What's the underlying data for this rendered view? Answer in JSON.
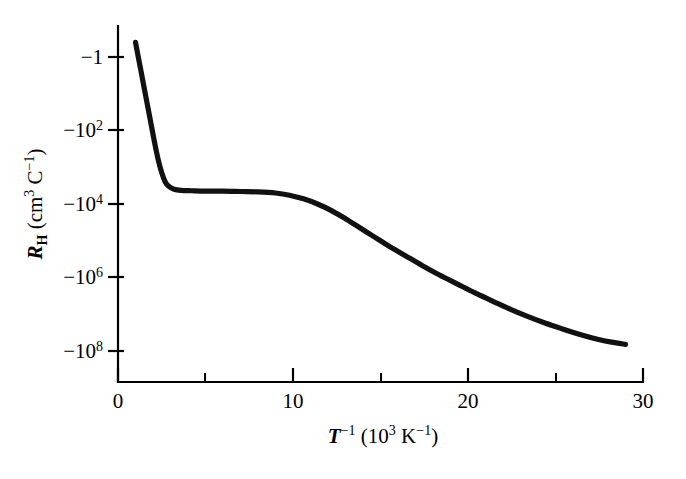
{
  "figure": {
    "background_color": "#ffffff",
    "ink_color": "#111111"
  },
  "chart_data": {
    "type": "line",
    "title": "",
    "subtitle": "",
    "xlabel": "T^-1 (10^3 K^-1)",
    "ylabel": "R_H (cm^3 C^-1)",
    "xlabel_parts": {
      "symbol": "T",
      "symbol_exponent": "−1",
      "units_open": " (10",
      "units_exponent": "3",
      "units_mid": " K",
      "units_exponent2": "−1",
      "units_close": ")"
    },
    "ylabel_parts": {
      "symbol": "R",
      "symbol_subscript": "H",
      "units_open": " (cm",
      "units_exponent": "3",
      "units_mid": " C",
      "units_exponent2": "−1",
      "units_close": ")"
    },
    "grid": false,
    "legend": false,
    "legend_position": "none",
    "xlim": [
      0,
      30
    ],
    "ylim_label": "negative logarithmic, -1 to -10^8",
    "x_ticks_major": [
      0,
      10,
      20,
      30
    ],
    "x_tick_labels": [
      "0",
      "10",
      "20",
      "30"
    ],
    "x_ticks_minor": [
      5,
      15,
      25
    ],
    "y_ticks_major": [
      {
        "label_mantissa": "−1",
        "label_exponent": "",
        "decade": 0
      },
      {
        "label_mantissa": "−10",
        "label_exponent": "2",
        "decade": 2
      },
      {
        "label_mantissa": "−10",
        "label_exponent": "4",
        "decade": 4
      },
      {
        "label_mantissa": "−10",
        "label_exponent": "6",
        "decade": 6
      },
      {
        "label_mantissa": "−10",
        "label_exponent": "8",
        "decade": 8
      }
    ],
    "y_tick_labels": [
      "−1",
      "−10²",
      "−10⁴",
      "−10⁶",
      "−10⁸"
    ],
    "series": [
      {
        "name": "Hall coefficient",
        "color": "#111111",
        "comment": "x = inverse temperature in 10^3 K^-1; y = decades of -R_H, i.e. R_H = -10^(y)",
        "x": [
          1.0,
          1.3,
          1.6,
          1.9,
          2.1,
          2.3,
          2.5,
          2.7,
          2.9,
          3.2,
          3.6,
          4.2,
          5.0,
          6.0,
          7.0,
          8.0,
          9.0,
          9.8,
          10.6,
          11.4,
          12.2,
          13.0,
          13.8,
          14.6,
          15.4,
          16.4,
          17.4,
          18.4,
          19.4,
          20.4,
          21.4,
          22.4,
          23.4,
          24.4,
          25.4,
          26.4,
          27.4,
          28.2,
          29.0
        ],
        "y": [
          -0.4,
          0.35,
          1.1,
          1.85,
          2.35,
          2.8,
          3.15,
          3.4,
          3.52,
          3.6,
          3.63,
          3.64,
          3.65,
          3.65,
          3.66,
          3.67,
          3.7,
          3.76,
          3.86,
          4.0,
          4.18,
          4.4,
          4.64,
          4.88,
          5.12,
          5.4,
          5.68,
          5.94,
          6.18,
          6.42,
          6.64,
          6.86,
          7.06,
          7.24,
          7.4,
          7.55,
          7.68,
          7.76,
          7.82
        ]
      }
    ],
    "annotations": [],
    "regions_described": [
      "intrinsic region: steep rise in |R_H| at small T^-1",
      "extrinsic saturation plateau near -10^3.65 cm^3 C^-1 between T^-1 = 3 and 9",
      "carrier freeze-out: near-linear increase of |R_H| for T^-1 above 13"
    ]
  },
  "geometry": {
    "plot_left_px": 118,
    "plot_right_px": 643,
    "y_tick_top_px": 57,
    "y_tick_bottom_px": 351,
    "decades_per_tick": 2,
    "px_per_decade": 36.75,
    "axis_top_px": 26,
    "axis_bottom_px": 382
  }
}
